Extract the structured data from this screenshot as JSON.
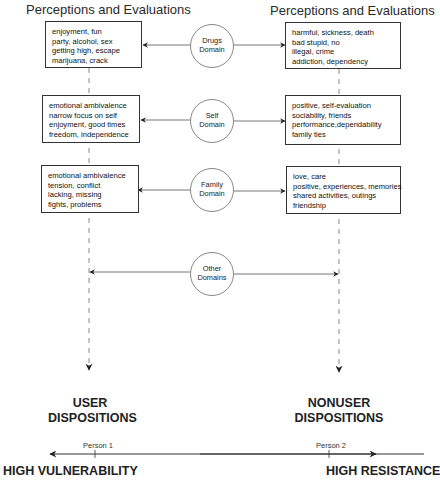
{
  "headers": {
    "left": "Perceptions and Evaluations",
    "right": "Perceptions and Evaluations"
  },
  "domains": [
    {
      "name": [
        "Drugs",
        "Domain"
      ],
      "user_perceptions": [
        "enjoyment, fun",
        "party, alcohol, sex",
        "getting high, escape",
        "marijuana, crack"
      ],
      "nonuser_perceptions": [
        "harmful, sickness, death",
        "bad stupid, no",
        "illegal, crime",
        "addiction, dependency"
      ]
    },
    {
      "name": [
        "Self",
        "Domain"
      ],
      "user_perceptions": [
        "emotional ambivalence",
        "narrow focus on self",
        "enjoyment, good times",
        "freedom, independence"
      ],
      "nonuser_perceptions": [
        "positive, self-evaluation",
        "sociability, friends",
        "performance,dependability",
        "family ties"
      ]
    },
    {
      "name": [
        "Family",
        "Domain"
      ],
      "user_perceptions": [
        "emotional ambivalence",
        "tension, conflict",
        "lacking, missing",
        "fights, problems"
      ],
      "nonuser_perceptions": [
        "love, care",
        "positive, experiences, memories",
        "shared activities, outings",
        "friendship"
      ]
    },
    {
      "name": [
        "Other",
        "Domains"
      ]
    }
  ],
  "dispositions": {
    "user": [
      "USER",
      "DISPOSITIONS"
    ],
    "nonuser": [
      "NONUSER",
      "DISPOSITIONS"
    ]
  },
  "scale": {
    "person1": "Person 1",
    "person2": "Person 2",
    "left_pole": "HIGH VULNERABILITY",
    "right_pole": "HIGH RESISTANCE"
  }
}
